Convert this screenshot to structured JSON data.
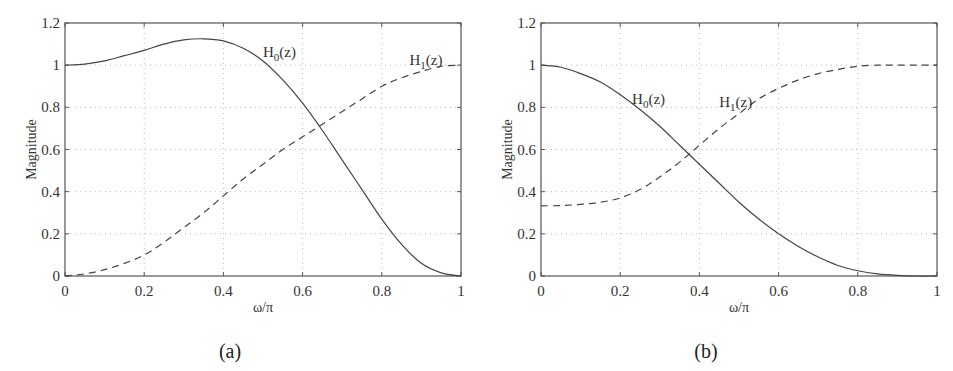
{
  "figure": {
    "panels": [
      {
        "caption": "(a)",
        "xlabel": "ω/π",
        "ylabel": "Magnitude",
        "xticks": [
          "0",
          "0.2",
          "0.4",
          "0.6",
          "0.8",
          "1"
        ],
        "yticks": [
          "0",
          "0.2",
          "0.4",
          "0.6",
          "0.8",
          "1",
          "1.2"
        ],
        "curve_labels": {
          "h0": {
            "main": "H",
            "sub": "0",
            "rest": "(z)"
          },
          "h1": {
            "main": "H",
            "sub": "1",
            "rest": "(z)"
          }
        }
      },
      {
        "caption": "(b)",
        "xlabel": "ω/π",
        "ylabel": "Magnitude",
        "xticks": [
          "0",
          "0.2",
          "0.4",
          "0.6",
          "0.8",
          "1"
        ],
        "yticks": [
          "0",
          "0.2",
          "0.4",
          "0.6",
          "0.8",
          "1",
          "1.2"
        ],
        "curve_labels": {
          "h0": {
            "main": "H",
            "sub": "0",
            "rest": "(z)"
          },
          "h1": {
            "main": "H",
            "sub": "1",
            "rest": "(z)"
          }
        }
      }
    ]
  },
  "chart_data": [
    {
      "type": "line",
      "title": "(a)",
      "xlabel": "ω/π",
      "ylabel": "Magnitude",
      "xlim": [
        0,
        1
      ],
      "ylim": [
        0,
        1.2
      ],
      "grid": true,
      "legend": "inline labels",
      "x": [
        0,
        0.05,
        0.1,
        0.15,
        0.2,
        0.25,
        0.3,
        0.35,
        0.4,
        0.45,
        0.5,
        0.55,
        0.6,
        0.65,
        0.7,
        0.75,
        0.8,
        0.85,
        0.9,
        0.95,
        1.0
      ],
      "series": [
        {
          "name": "H0(z)",
          "style": "solid",
          "values": [
            1.0,
            1.005,
            1.02,
            1.045,
            1.07,
            1.1,
            1.12,
            1.125,
            1.115,
            1.08,
            1.02,
            0.93,
            0.82,
            0.69,
            0.55,
            0.41,
            0.27,
            0.15,
            0.06,
            0.015,
            0.0
          ]
        },
        {
          "name": "H1(z)",
          "style": "dashed",
          "values": [
            0.0,
            0.01,
            0.03,
            0.06,
            0.1,
            0.16,
            0.23,
            0.3,
            0.38,
            0.46,
            0.53,
            0.6,
            0.66,
            0.72,
            0.78,
            0.84,
            0.9,
            0.94,
            0.97,
            0.995,
            1.0
          ]
        }
      ],
      "annotations": [
        "H0(z) label near (0.5, 1.05)",
        "H1(z) label near (0.87, 1.0)"
      ]
    },
    {
      "type": "line",
      "title": "(b)",
      "xlabel": "ω/π",
      "ylabel": "Magnitude",
      "xlim": [
        0,
        1
      ],
      "ylim": [
        0,
        1.2
      ],
      "grid": true,
      "legend": "inline labels",
      "x": [
        0,
        0.05,
        0.1,
        0.15,
        0.2,
        0.25,
        0.3,
        0.35,
        0.4,
        0.45,
        0.5,
        0.55,
        0.6,
        0.65,
        0.7,
        0.75,
        0.8,
        0.85,
        0.9,
        0.95,
        1.0
      ],
      "series": [
        {
          "name": "H0(z)",
          "style": "solid",
          "values": [
            1.0,
            0.99,
            0.96,
            0.92,
            0.86,
            0.79,
            0.71,
            0.62,
            0.53,
            0.44,
            0.35,
            0.27,
            0.2,
            0.14,
            0.09,
            0.05,
            0.025,
            0.01,
            0.003,
            0.0,
            0.0
          ]
        },
        {
          "name": "H1(z)",
          "style": "dashed",
          "values": [
            0.333,
            0.334,
            0.34,
            0.35,
            0.37,
            0.41,
            0.47,
            0.54,
            0.62,
            0.7,
            0.77,
            0.84,
            0.89,
            0.93,
            0.96,
            0.98,
            0.995,
            1.0,
            1.0,
            1.0,
            1.0
          ]
        }
      ],
      "annotations": [
        "H0(z) label near (0.23, 0.83)",
        "H1(z) label near (0.45, 0.8)"
      ]
    }
  ]
}
